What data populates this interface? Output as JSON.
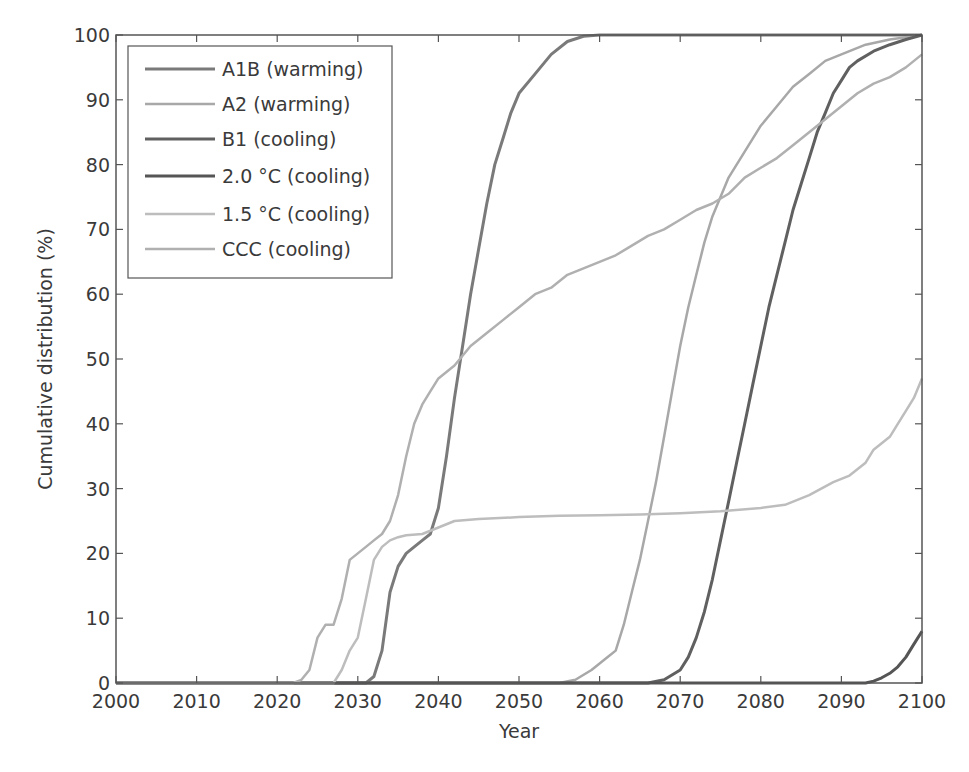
{
  "chart_data": {
    "type": "line",
    "title": "",
    "xlabel": "Year",
    "ylabel": "Cumulative distribution (%)",
    "xlim": [
      2000,
      2100
    ],
    "ylim": [
      0,
      100
    ],
    "x_ticks": [
      "2000",
      "2010",
      "2020",
      "2030",
      "2040",
      "2050",
      "2060",
      "2070",
      "2080",
      "2090",
      "2100"
    ],
    "y_ticks": [
      "0",
      "10",
      "20",
      "30",
      "40",
      "50",
      "60",
      "70",
      "80",
      "90",
      "100"
    ],
    "grid": false,
    "legend_position": "upper left",
    "series": [
      {
        "name": "A1B (warming)",
        "color": "#7a7a7a",
        "width": 3,
        "points": [
          [
            2000,
            0
          ],
          [
            2031,
            0
          ],
          [
            2032,
            1
          ],
          [
            2033,
            5
          ],
          [
            2034,
            14
          ],
          [
            2035,
            18
          ],
          [
            2036,
            20
          ],
          [
            2037,
            21
          ],
          [
            2038,
            22
          ],
          [
            2039,
            23
          ],
          [
            2040,
            27
          ],
          [
            2041,
            35
          ],
          [
            2042,
            44
          ],
          [
            2043,
            52
          ],
          [
            2044,
            60
          ],
          [
            2045,
            67
          ],
          [
            2046,
            74
          ],
          [
            2047,
            80
          ],
          [
            2048,
            84
          ],
          [
            2049,
            88
          ],
          [
            2050,
            91
          ],
          [
            2052,
            94
          ],
          [
            2054,
            97
          ],
          [
            2056,
            99
          ],
          [
            2058,
            99.8
          ],
          [
            2060,
            100
          ],
          [
            2100,
            100
          ]
        ]
      },
      {
        "name": "A2 (warming)",
        "color": "#a8a8a8",
        "width": 2.5,
        "points": [
          [
            2000,
            0
          ],
          [
            2055,
            0
          ],
          [
            2057,
            0.5
          ],
          [
            2059,
            2
          ],
          [
            2061,
            4
          ],
          [
            2062,
            5
          ],
          [
            2063,
            9
          ],
          [
            2064,
            14
          ],
          [
            2065,
            19
          ],
          [
            2066,
            25
          ],
          [
            2067,
            31
          ],
          [
            2068,
            38
          ],
          [
            2069,
            45
          ],
          [
            2070,
            52
          ],
          [
            2071,
            58
          ],
          [
            2072,
            63
          ],
          [
            2073,
            68
          ],
          [
            2074,
            72
          ],
          [
            2075,
            75
          ],
          [
            2076,
            78
          ],
          [
            2078,
            82
          ],
          [
            2080,
            86
          ],
          [
            2082,
            89
          ],
          [
            2084,
            92
          ],
          [
            2086,
            94
          ],
          [
            2088,
            96
          ],
          [
            2090,
            97
          ],
          [
            2093,
            98.5
          ],
          [
            2096,
            99.3
          ],
          [
            2100,
            100
          ]
        ]
      },
      {
        "name": "B1 (cooling)",
        "color": "#606060",
        "width": 3,
        "points": [
          [
            2000,
            0
          ],
          [
            2066,
            0
          ],
          [
            2068,
            0.5
          ],
          [
            2070,
            2
          ],
          [
            2071,
            4
          ],
          [
            2072,
            7
          ],
          [
            2073,
            11
          ],
          [
            2074,
            16
          ],
          [
            2075,
            22
          ],
          [
            2076,
            28
          ],
          [
            2077,
            34
          ],
          [
            2078,
            40
          ],
          [
            2079,
            46
          ],
          [
            2080,
            52
          ],
          [
            2081,
            58
          ],
          [
            2082,
            63
          ],
          [
            2083,
            68
          ],
          [
            2084,
            73
          ],
          [
            2085,
            77
          ],
          [
            2086,
            81
          ],
          [
            2087,
            85
          ],
          [
            2088,
            88
          ],
          [
            2089,
            91
          ],
          [
            2090,
            93
          ],
          [
            2091,
            95
          ],
          [
            2092,
            96
          ],
          [
            2094,
            97.5
          ],
          [
            2096,
            98.5
          ],
          [
            2098,
            99.3
          ],
          [
            2100,
            100
          ]
        ]
      },
      {
        "name": "2.0 °C (cooling)",
        "color": "#555555",
        "width": 3,
        "points": [
          [
            2000,
            0
          ],
          [
            2093,
            0
          ],
          [
            2094,
            0.3
          ],
          [
            2095,
            0.8
          ],
          [
            2096,
            1.5
          ],
          [
            2097,
            2.5
          ],
          [
            2098,
            4
          ],
          [
            2099,
            6
          ],
          [
            2100,
            8
          ]
        ]
      },
      {
        "name": "1.5 °C (cooling)",
        "color": "#bdbdbd",
        "width": 2.5,
        "points": [
          [
            2000,
            0
          ],
          [
            2027,
            0
          ],
          [
            2028,
            2
          ],
          [
            2029,
            5
          ],
          [
            2030,
            7
          ],
          [
            2031,
            13
          ],
          [
            2032,
            19
          ],
          [
            2033,
            21
          ],
          [
            2034,
            22
          ],
          [
            2035,
            22.5
          ],
          [
            2036,
            22.8
          ],
          [
            2038,
            23
          ],
          [
            2040,
            24
          ],
          [
            2042,
            25
          ],
          [
            2045,
            25.3
          ],
          [
            2050,
            25.6
          ],
          [
            2055,
            25.8
          ],
          [
            2060,
            25.9
          ],
          [
            2065,
            26
          ],
          [
            2070,
            26.2
          ],
          [
            2075,
            26.5
          ],
          [
            2080,
            27
          ],
          [
            2083,
            27.5
          ],
          [
            2086,
            29
          ],
          [
            2089,
            31
          ],
          [
            2091,
            32
          ],
          [
            2093,
            34
          ],
          [
            2094,
            36
          ],
          [
            2095,
            37
          ],
          [
            2096,
            38
          ],
          [
            2097,
            40
          ],
          [
            2098,
            42
          ],
          [
            2099,
            44
          ],
          [
            2100,
            47
          ]
        ]
      },
      {
        "name": "CCC (cooling)",
        "color": "#b0b0b0",
        "width": 2.5,
        "points": [
          [
            2000,
            0
          ],
          [
            2022,
            0
          ],
          [
            2023,
            0.5
          ],
          [
            2024,
            2
          ],
          [
            2025,
            7
          ],
          [
            2026,
            9
          ],
          [
            2027,
            9
          ],
          [
            2028,
            13
          ],
          [
            2029,
            19
          ],
          [
            2030,
            20
          ],
          [
            2031,
            21
          ],
          [
            2032,
            22
          ],
          [
            2033,
            23
          ],
          [
            2034,
            25
          ],
          [
            2035,
            29
          ],
          [
            2036,
            35
          ],
          [
            2037,
            40
          ],
          [
            2038,
            43
          ],
          [
            2039,
            45
          ],
          [
            2040,
            47
          ],
          [
            2042,
            49
          ],
          [
            2044,
            52
          ],
          [
            2046,
            54
          ],
          [
            2048,
            56
          ],
          [
            2050,
            58
          ],
          [
            2052,
            60
          ],
          [
            2054,
            61
          ],
          [
            2056,
            63
          ],
          [
            2058,
            64
          ],
          [
            2060,
            65
          ],
          [
            2062,
            66
          ],
          [
            2064,
            67.5
          ],
          [
            2066,
            69
          ],
          [
            2068,
            70
          ],
          [
            2070,
            71.5
          ],
          [
            2072,
            73
          ],
          [
            2074,
            74
          ],
          [
            2076,
            75.5
          ],
          [
            2078,
            78
          ],
          [
            2080,
            79.5
          ],
          [
            2082,
            81
          ],
          [
            2084,
            83
          ],
          [
            2086,
            85
          ],
          [
            2088,
            87
          ],
          [
            2090,
            89
          ],
          [
            2092,
            91
          ],
          [
            2094,
            92.5
          ],
          [
            2096,
            93.5
          ],
          [
            2098,
            95
          ],
          [
            2100,
            97
          ]
        ]
      }
    ]
  }
}
